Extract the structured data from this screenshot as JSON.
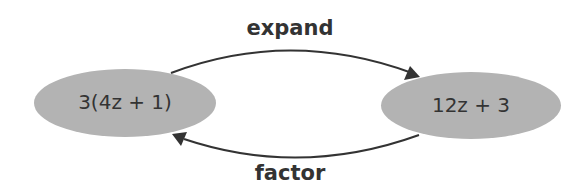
{
  "diagram": {
    "nodes": [
      {
        "id": "left",
        "text": "3(4z + 1)"
      },
      {
        "id": "right",
        "text": "12z + 3"
      }
    ],
    "edges": [
      {
        "from": "left",
        "to": "right",
        "label": "expand"
      },
      {
        "from": "right",
        "to": "left",
        "label": "factor"
      }
    ],
    "colors": {
      "node_fill": "#b3b3b3",
      "stroke": "#333333",
      "text": "#333333",
      "background": "#ffffff"
    }
  }
}
